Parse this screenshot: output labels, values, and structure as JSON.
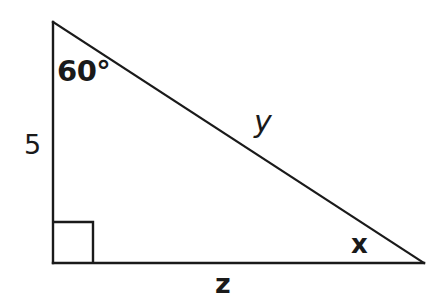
{
  "figure": {
    "kind": "right-triangle-diagram",
    "background_color": "#ffffff",
    "stroke_color": "#1a1a1a",
    "stroke_width": 2
  },
  "geometry": {
    "apex": {
      "x": 53,
      "y": 22
    },
    "right_angle_vertex": {
      "x": 53,
      "y": 263
    },
    "bottom_right_vertex": {
      "x": 424,
      "y": 263
    },
    "right_angle_marker": {
      "x": 53,
      "y": 222,
      "size": 40
    }
  },
  "labels": {
    "angle_top": "60°",
    "side_vertical": "5",
    "side_hypotenuse": "y",
    "side_base": "z",
    "angle_bottom_right": "x"
  }
}
